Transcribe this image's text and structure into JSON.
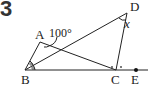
{
  "problem": {
    "number": "3"
  },
  "figure": {
    "points": {
      "A": {
        "label": "A",
        "x": 40,
        "y": 42
      },
      "B": {
        "label": "B",
        "x": 25,
        "y": 70
      },
      "C": {
        "label": "C",
        "x": 116,
        "y": 70
      },
      "D": {
        "label": "D",
        "x": 127,
        "y": 13
      },
      "E": {
        "label": "E",
        "x": 136,
        "y": 70
      }
    },
    "angle_A_label": "100°",
    "angle_D_label": "x",
    "marks": {
      "angle_B": "bisector marks (two equal angles)",
      "angle_C": "bisector marks (x × marks)"
    },
    "stroke_color": "#222222",
    "background": "#ffffff"
  }
}
